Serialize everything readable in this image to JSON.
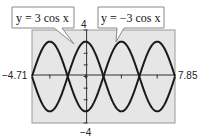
{
  "chart_data": {
    "type": "line",
    "title": "",
    "xlabel": "",
    "ylabel": "",
    "xlim": [
      -4.71,
      7.85
    ],
    "ylim": [
      -4,
      4
    ],
    "grid": false,
    "x_tick_labels": [
      "-4.71",
      "7.85"
    ],
    "y_tick_labels": [
      "4",
      "-4"
    ],
    "series": [
      {
        "name": "y = 3 cos x",
        "function": "3*cos(x)",
        "amplitude": 3
      },
      {
        "name": "y = -3 cos x",
        "function": "-3*cos(x)",
        "amplitude": -3
      }
    ],
    "annotations": [
      "y = 3 cos x",
      "y = −3 cos x"
    ]
  },
  "labels": {
    "xmin": "−4.71",
    "xmax": "7.85",
    "ymax": "4",
    "ymin": "−4",
    "callout1": "y = 3 cos x",
    "callout2": "y = −3 cos x"
  },
  "colors": {
    "plot_bg": "#e6e6e6",
    "curve": "#1a1a1a",
    "frame": "#888888"
  }
}
